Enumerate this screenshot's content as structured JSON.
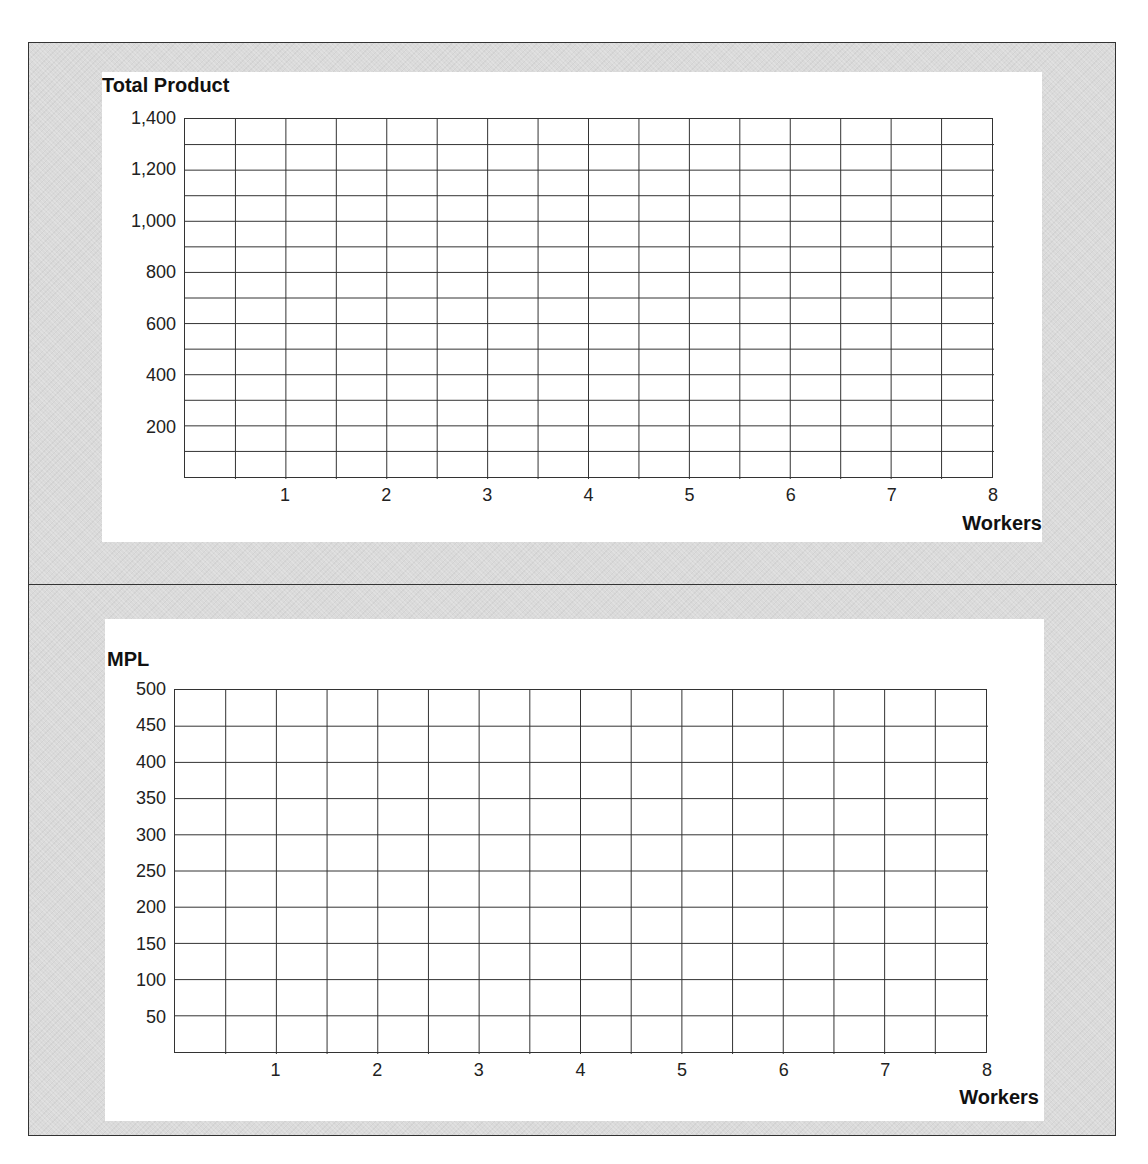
{
  "colors": {
    "frame_background": "#dadada",
    "panel_background": "#ffffff",
    "grid_line": "#333333",
    "border": "#333333"
  },
  "chart_data": [
    {
      "type": "line",
      "title": "Total Product",
      "ylabel": "Total Product",
      "xlabel": "Workers",
      "x_ticks": [
        "1",
        "2",
        "3",
        "4",
        "5",
        "6",
        "7",
        "8"
      ],
      "y_ticks": [
        "1,400",
        "1,200",
        "1,000",
        "800",
        "600",
        "400",
        "200"
      ],
      "xlim": [
        0,
        8
      ],
      "ylim": [
        0,
        1400
      ],
      "grid": true,
      "grid_columns": 16,
      "grid_rows": 14,
      "series": []
    },
    {
      "type": "line",
      "title": "MPL",
      "ylabel": "MPL",
      "xlabel": "Workers",
      "x_ticks": [
        "1",
        "2",
        "3",
        "4",
        "5",
        "6",
        "7",
        "8"
      ],
      "y_ticks": [
        "500",
        "450",
        "400",
        "350",
        "300",
        "250",
        "200",
        "150",
        "100",
        "50"
      ],
      "xlim": [
        0,
        8
      ],
      "ylim": [
        0,
        500
      ],
      "grid": true,
      "grid_columns": 16,
      "grid_rows": 10,
      "series": []
    }
  ]
}
